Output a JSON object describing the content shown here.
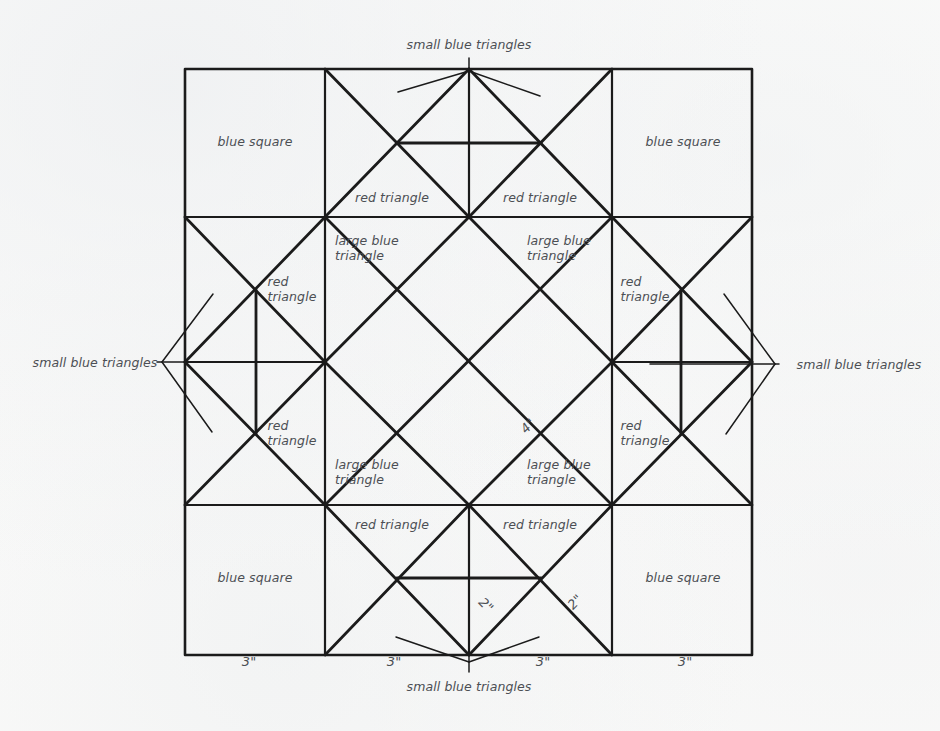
{
  "diagram": {
    "kind": "quilt-block-piecing-diagram",
    "ink_color": "#1b1b1b",
    "text_color": "#4c4f54",
    "paper_color": "#fbfbfa",
    "block_size_label": "12 inch block (4 x 3 inch grid)"
  },
  "labels": {
    "blue_square": "blue square",
    "red_triangle": "red triangle",
    "large_blue_triangle": "large blue\ntriangle",
    "red_triangle_stacked": "red\ntriangle",
    "small_blue_triangles": "small blue triangles"
  },
  "dimensions": {
    "three_inch": "3\"",
    "two_inch": "2\"",
    "four_inch": "4\""
  },
  "patches": [
    {
      "id": "blue-square-top-left",
      "label": "blue square",
      "x": 255,
      "y": 141
    },
    {
      "id": "blue-square-top-right",
      "label": "blue square",
      "x": 683,
      "y": 141
    },
    {
      "id": "blue-square-bottom-left",
      "label": "blue square",
      "x": 255,
      "y": 577
    },
    {
      "id": "blue-square-bottom-right",
      "label": "blue square",
      "x": 683,
      "y": 577
    },
    {
      "id": "red-triangle-top-left",
      "label": "red triangle",
      "x": 392,
      "y": 197
    },
    {
      "id": "red-triangle-top-right",
      "label": "red triangle",
      "x": 540,
      "y": 197
    },
    {
      "id": "red-triangle-bottom-left",
      "label": "red triangle",
      "x": 392,
      "y": 524
    },
    {
      "id": "red-triangle-bottom-right",
      "label": "red triangle",
      "x": 540,
      "y": 524
    },
    {
      "id": "red-triangle-left-upper",
      "label": "red\ntriangle",
      "x": 292,
      "y": 289
    },
    {
      "id": "red-triangle-left-lower",
      "label": "red\ntriangle",
      "x": 292,
      "y": 433
    },
    {
      "id": "red-triangle-right-upper",
      "label": "red\ntriangle",
      "x": 645,
      "y": 289
    },
    {
      "id": "red-triangle-right-lower",
      "label": "red\ntriangle",
      "x": 645,
      "y": 433
    },
    {
      "id": "large-blue-triangle-top-left",
      "label": "large blue\ntriangle",
      "x": 375,
      "y": 249
    },
    {
      "id": "large-blue-triangle-top-right",
      "label": "large blue\ntriangle",
      "x": 562,
      "y": 249
    },
    {
      "id": "large-blue-triangle-bottom-left",
      "label": "large blue\ntriangle",
      "x": 375,
      "y": 473
    },
    {
      "id": "large-blue-triangle-bottom-right",
      "label": "large blue\ntriangle",
      "x": 562,
      "y": 473
    }
  ],
  "callouts": [
    {
      "id": "callout-top",
      "label": "small blue triangles",
      "x": 469,
      "y": 44,
      "anchor": "center"
    },
    {
      "id": "callout-left",
      "label": "small blue triangles",
      "x": 95,
      "y": 362,
      "anchor": "center"
    },
    {
      "id": "callout-right",
      "label": "small blue triangles",
      "x": 859,
      "y": 364,
      "anchor": "center"
    },
    {
      "id": "callout-bottom",
      "label": "small blue triangles",
      "x": 469,
      "y": 686,
      "anchor": "center"
    }
  ],
  "measurements": [
    {
      "id": "dim-bottom-1",
      "label": "3\"",
      "x": 249,
      "y": 661,
      "rotation": 0
    },
    {
      "id": "dim-bottom-2",
      "label": "3\"",
      "x": 394,
      "y": 661,
      "rotation": 0
    },
    {
      "id": "dim-bottom-3",
      "label": "3\"",
      "x": 543,
      "y": 661,
      "rotation": 0
    },
    {
      "id": "dim-bottom-4",
      "label": "3\"",
      "x": 685,
      "y": 661,
      "rotation": 0
    },
    {
      "id": "dim-diagonal-left",
      "label": "2\"",
      "x": 486,
      "y": 605,
      "rotation": 45
    },
    {
      "id": "dim-diagonal-right",
      "label": "2\"",
      "x": 575,
      "y": 602,
      "rotation": -45
    },
    {
      "id": "dim-center-diagonal",
      "label": "4\"",
      "x": 528,
      "y": 426,
      "rotation": -45
    }
  ],
  "geometry": {
    "block": {
      "left": 185,
      "top": 69,
      "right": 752,
      "bottom": 655
    },
    "grid_x": [
      185,
      325,
      469,
      612,
      752
    ],
    "grid_y": [
      69,
      217,
      362,
      505,
      655
    ]
  }
}
